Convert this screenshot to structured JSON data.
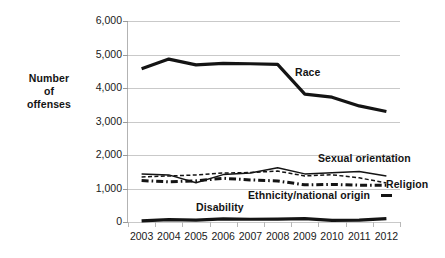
{
  "chart_data": {
    "type": "line",
    "title": "",
    "subtitle": "",
    "xlabel": "",
    "ylabel": "Number of offenses",
    "ylabel_lines": [
      "Number",
      "of",
      "offenses"
    ],
    "categories": [
      "2003",
      "2004",
      "2005",
      "2006",
      "2007",
      "2008",
      "2009",
      "2010",
      "2011",
      "2012"
    ],
    "x": [
      2003,
      2004,
      2005,
      2006,
      2007,
      2008,
      2009,
      2010,
      2011,
      2012
    ],
    "ylim": [
      0,
      6000
    ],
    "ytick_labels": [
      "0",
      "1,000",
      "2,000",
      "3,000",
      "4,000",
      "5,000",
      "6,000"
    ],
    "ytick_values": [
      0,
      1000,
      2000,
      3000,
      4000,
      5000,
      6000
    ],
    "grid": true,
    "legend_position": "inline-annotations",
    "series": [
      {
        "name": "Race",
        "style": "thick-solid",
        "color": "#141414",
        "values": [
          4574,
          4863,
          4691,
          4737,
          4724,
          4704,
          3816,
          3725,
          3465,
          3297
        ]
      },
      {
        "name": "Sexual orientation",
        "style": "thin-solid",
        "color": "#141414",
        "values": [
          1430,
          1406,
          1171,
          1415,
          1460,
          1617,
          1436,
          1470,
          1508,
          1376
        ]
      },
      {
        "name": "Religion",
        "style": "dashed",
        "color": "#141414",
        "values": [
          1343,
          1374,
          1405,
          1462,
          1477,
          1519,
          1376,
          1409,
          1318,
          1166
        ]
      },
      {
        "name": "Ethnicity/national origin",
        "style": "dash-dot-thick",
        "color": "#141414",
        "values": [
          1236,
          1201,
          1228,
          1305,
          1256,
          1226,
          1109,
          1122,
          1099,
          1099
        ]
      },
      {
        "name": "Disability",
        "style": "thick-solid",
        "color": "#141414",
        "values": [
          36,
          73,
          53,
          95,
          82,
          85,
          99,
          48,
          58,
          102
        ]
      }
    ],
    "annotations": [
      {
        "text": "Race",
        "series": "Race"
      },
      {
        "text": "Sexual orientation",
        "series": "Sexual orientation"
      },
      {
        "text": "Religion",
        "series": "Religion"
      },
      {
        "text": "Ethnicity/national origin",
        "series": "Ethnicity/national origin"
      },
      {
        "text": "Disability",
        "series": "Disability"
      }
    ]
  },
  "annotation_labels": {
    "race": "Race",
    "sexual_orientation": "Sexual orientation",
    "religion": "Religion",
    "ethnicity": "Ethnicity/national origin",
    "disability": "Disability"
  },
  "axis": {
    "y_title_line1": "Number",
    "y_title_line2": "of",
    "y_title_line3": "offenses"
  }
}
